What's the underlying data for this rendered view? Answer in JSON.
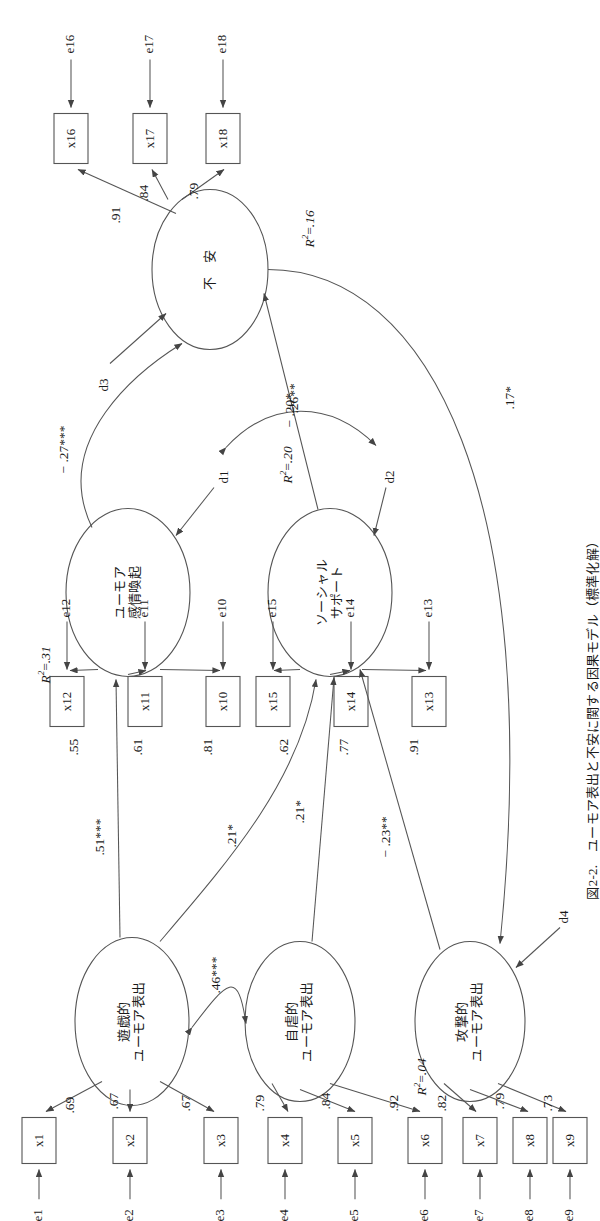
{
  "figure": {
    "caption": "図2-2.　ユーモア表出と不安に関する因果モデル（標準化解）",
    "type": "structural-equation-model-path-diagram",
    "orientation": "rotated-90-ccw"
  },
  "latent_variables": [
    {
      "id": "playful",
      "label_lines": [
        "遊戯的",
        "ユーモア表出"
      ],
      "r2": null
    },
    {
      "id": "selfdep",
      "label_lines": [
        "自虐的",
        "ユーモア表出"
      ],
      "r2": null
    },
    {
      "id": "aggress",
      "label_lines": [
        "攻撃的",
        "ユーモア表出"
      ],
      "r2": ".04"
    },
    {
      "id": "arousal",
      "label_lines": [
        "ユーモア",
        "感情喚起"
      ],
      "r2": ".31"
    },
    {
      "id": "support",
      "label_lines": [
        "ソーシャル",
        "サポート"
      ],
      "r2": ".20"
    },
    {
      "id": "anxiety",
      "label_lines": [
        "不　安"
      ],
      "r2": ".16"
    }
  ],
  "r2_labels": {
    "aggress": ".04",
    "arousal": ".31",
    "support": ".20",
    "anxiety": ".16"
  },
  "observed_variables": [
    "x1",
    "x2",
    "x3",
    "x4",
    "x5",
    "x6",
    "x7",
    "x8",
    "x9",
    "x10",
    "x11",
    "x12",
    "x13",
    "x14",
    "x15",
    "x16",
    "x17",
    "x18"
  ],
  "error_terms": [
    "e1",
    "e2",
    "e3",
    "e4",
    "e5",
    "e6",
    "e7",
    "e8",
    "e9",
    "e10",
    "e11",
    "e12",
    "e13",
    "e14",
    "e15",
    "e16",
    "e17",
    "e18"
  ],
  "disturbance_terms": [
    "d1",
    "d2",
    "d3",
    "d4"
  ],
  "measurement_loadings": [
    {
      "from": "playful",
      "to": "x1",
      "value": ".69"
    },
    {
      "from": "playful",
      "to": "x2",
      "value": ".67"
    },
    {
      "from": "playful",
      "to": "x3",
      "value": ".67"
    },
    {
      "from": "selfdep",
      "to": "x4",
      "value": ".79"
    },
    {
      "from": "selfdep",
      "to": "x5",
      "value": ".84"
    },
    {
      "from": "selfdep",
      "to": "x6",
      "value": ".92"
    },
    {
      "from": "aggress",
      "to": "x7",
      "value": ".82"
    },
    {
      "from": "aggress",
      "to": "x8",
      "value": ".79"
    },
    {
      "from": "aggress",
      "to": "x9",
      "value": ".73"
    },
    {
      "from": "arousal",
      "to": "x10",
      "value": ".81"
    },
    {
      "from": "arousal",
      "to": "x11",
      "value": ".61"
    },
    {
      "from": "arousal",
      "to": "x12",
      "value": ".55"
    },
    {
      "from": "support",
      "to": "x13",
      "value": ".91"
    },
    {
      "from": "support",
      "to": "x14",
      "value": ".77"
    },
    {
      "from": "support",
      "to": "x15",
      "value": ".62"
    },
    {
      "from": "anxiety",
      "to": "x16",
      "value": ".91"
    },
    {
      "from": "anxiety",
      "to": "x17",
      "value": ".84"
    },
    {
      "from": "anxiety",
      "to": "x18",
      "value": ".79"
    }
  ],
  "structural_paths": [
    {
      "from": "playful",
      "to": "arousal",
      "value": ".51***"
    },
    {
      "from": "playful",
      "to": "support",
      "value": ".21*"
    },
    {
      "from": "selfdep",
      "to": "support",
      "value": ".21*"
    },
    {
      "from": "aggress",
      "to": "support",
      "value": "− .23**"
    },
    {
      "from": "arousal",
      "to": "anxiety",
      "value": "− .27***"
    },
    {
      "from": "support",
      "to": "anxiety",
      "value": "− .20*"
    },
    {
      "from": "anxiety",
      "to": "aggress",
      "value": ".17*"
    }
  ],
  "correlations": [
    {
      "between": [
        "playful",
        "selfdep"
      ],
      "value": ".46***"
    },
    {
      "between": [
        "d1",
        "d2"
      ],
      "value": ".26**"
    }
  ],
  "coefficient_labels": {
    "l_x1": ".69",
    "l_x2": ".67",
    "l_x3": ".67",
    "l_x4": ".79",
    "l_x5": ".84",
    "l_x6": ".92",
    "l_x7": ".82",
    "l_x8": ".79",
    "l_x9": ".73",
    "l_x10": ".81",
    "l_x11": ".61",
    "l_x12": ".55",
    "l_x13": ".91",
    "l_x14": ".77",
    "l_x15": ".62",
    "l_x16": ".91",
    "l_x17": ".84",
    "l_x18": ".79",
    "p_playful_arousal": ".51***",
    "p_playful_support": ".21*",
    "p_selfdep_support": ".21*",
    "p_aggress_support": "− .23**",
    "p_arousal_anxiety": "− .27***",
    "p_support_anxiety": "− .20*",
    "p_anxiety_aggress": ".17*",
    "c_playful_selfdep": ".46***",
    "c_d1_d2": ".26**"
  },
  "node_text": {
    "playful_1": "遊戯的",
    "playful_2": "ユーモア表出",
    "selfdep_1": "自虐的",
    "selfdep_2": "ユーモア表出",
    "aggress_1": "攻撃的",
    "aggress_2": "ユーモア表出",
    "arousal_1": "ユーモア",
    "arousal_2": "感情喚起",
    "support_1": "ソーシャル",
    "support_2": "サポート",
    "anxiety_1": "不　安"
  },
  "box_text": {
    "x1": "x1",
    "x2": "x2",
    "x3": "x3",
    "x4": "x4",
    "x5": "x5",
    "x6": "x6",
    "x7": "x7",
    "x8": "x8",
    "x9": "x9",
    "x10": "x10",
    "x11": "x11",
    "x12": "x12",
    "x13": "x13",
    "x14": "x14",
    "x15": "x15",
    "x16": "x16",
    "x17": "x17",
    "x18": "x18"
  },
  "err_text": {
    "e1": "e1",
    "e2": "e2",
    "e3": "e3",
    "e4": "e4",
    "e5": "e5",
    "e6": "e6",
    "e7": "e7",
    "e8": "e8",
    "e9": "e9",
    "e10": "e10",
    "e11": "e11",
    "e12": "e12",
    "e13": "e13",
    "e14": "e14",
    "e15": "e15",
    "e16": "e16",
    "e17": "e17",
    "e18": "e18",
    "d1": "d1",
    "d2": "d2",
    "d3": "d3",
    "d4": "d4"
  },
  "colors": {
    "stroke": "#555555",
    "text": "#1a1a1a",
    "background": "#ffffff"
  }
}
